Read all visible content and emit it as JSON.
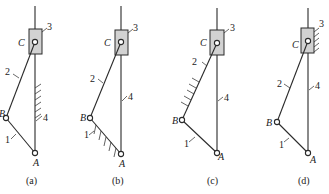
{
  "figure": {
    "joint_labels": {
      "A": "A",
      "B": "B",
      "C": "C"
    },
    "link_labels": {
      "l1": "1",
      "l2": "2",
      "l3": "3",
      "l4": "4"
    },
    "panels": [
      {
        "caption": "(a)",
        "fixed_link": "4"
      },
      {
        "caption": "(b)",
        "fixed_link": "1"
      },
      {
        "caption": "(c)",
        "fixed_link": "2"
      },
      {
        "caption": "(d)",
        "fixed_link": "3"
      }
    ]
  }
}
